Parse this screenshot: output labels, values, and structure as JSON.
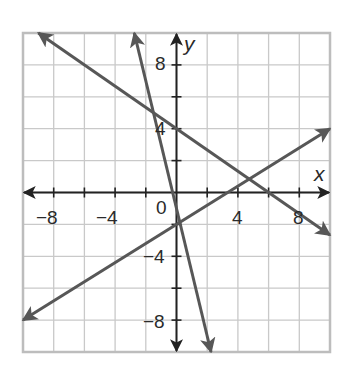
{
  "chart_data": {
    "type": "line",
    "title": "",
    "xlabel": "x",
    "ylabel": "y",
    "xlim": [
      -10,
      10
    ],
    "ylim": [
      -10,
      10
    ],
    "grid": true,
    "grid_step": 2,
    "tick_step": 2,
    "x_tick_labels": [
      "-8",
      "-4",
      "0",
      "4",
      "8"
    ],
    "y_tick_labels": [
      "8",
      "4",
      "-4",
      "-8"
    ],
    "origin_label": "0",
    "arrows_both_ends": true,
    "series": [
      {
        "name": "line-1",
        "equation": "y = -2/3 x + 4",
        "slope": -0.6667,
        "intercept": 4,
        "points": [
          [
            -9,
            10
          ],
          [
            10,
            -2.67
          ]
        ]
      },
      {
        "name": "line-2",
        "equation": "y = -4x - 1",
        "slope": -4,
        "intercept": -1,
        "points": [
          [
            -2.75,
            10
          ],
          [
            2.25,
            -10
          ]
        ]
      },
      {
        "name": "line-3",
        "equation": "y = 3/5 x - 2",
        "slope": 0.6,
        "intercept": -2,
        "points": [
          [
            -10,
            -8
          ],
          [
            10,
            4
          ]
        ]
      }
    ],
    "intersections": [
      {
        "lines": [
          "line-1",
          "line-2"
        ],
        "approx": [
          -1.5,
          5
        ]
      },
      {
        "lines": [
          "line-1",
          "line-3"
        ],
        "approx": [
          4.7,
          0.9
        ]
      },
      {
        "lines": [
          "line-2",
          "line-3"
        ],
        "approx": [
          -0.2,
          -2.1
        ]
      }
    ]
  },
  "labels": {
    "x_axis": "x",
    "y_axis": "y",
    "x_ticks": [
      {
        "text": "−8",
        "value": -8
      },
      {
        "text": "−4",
        "value": -4
      },
      {
        "text": "4",
        "value": 4
      },
      {
        "text": "8",
        "value": 8
      }
    ],
    "y_ticks": [
      {
        "text": "8",
        "value": 8
      },
      {
        "text": "4",
        "value": 4
      },
      {
        "text": "−4",
        "value": -4
      },
      {
        "text": "−8",
        "value": -8
      }
    ],
    "origin": "0"
  },
  "colors": {
    "grid": "#c9c9c9",
    "border": "#bdbdbd",
    "axes": "#222222",
    "lines": "#575757",
    "background": "#ffffff"
  }
}
